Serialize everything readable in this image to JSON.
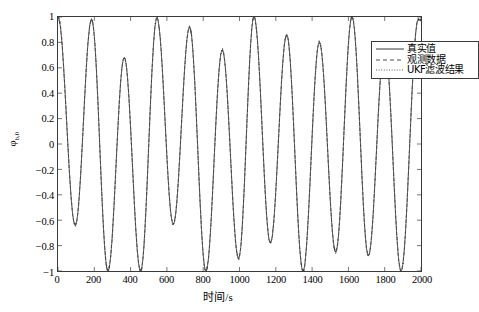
{
  "chart_data": {
    "type": "line",
    "title": "",
    "xlabel": "时间/s",
    "ylabel": "φb,0",
    "xlim": [
      0,
      2000
    ],
    "ylim": [
      -1,
      1
    ],
    "xticks": [
      0,
      200,
      400,
      600,
      800,
      1000,
      1200,
      1400,
      1600,
      1800,
      2000
    ],
    "yticks": [
      -1,
      -0.8,
      -0.6,
      -0.4,
      -0.2,
      0,
      0.2,
      0.4,
      0.6,
      0.8,
      1
    ],
    "xtick_labels": [
      "0",
      "200",
      "400",
      "600",
      "800",
      "1000",
      "1200",
      "1400",
      "1600",
      "1800",
      "2000"
    ],
    "ytick_labels": [
      "-1",
      "-0.8",
      "-0.6",
      "-0.4",
      "-0.2",
      "0",
      "0.2",
      "0.4",
      "0.6",
      "0.8",
      "1"
    ],
    "grid": false,
    "legend_position": "top-right",
    "period": 180,
    "series": [
      {
        "name": "真实值",
        "style": "solid",
        "color": "#222222",
        "peaks": [
          {
            "x": 0,
            "y": 1.0
          },
          {
            "x": 185,
            "y": 0.98
          },
          {
            "x": 365,
            "y": 0.68
          },
          {
            "x": 545,
            "y": 0.99
          },
          {
            "x": 725,
            "y": 0.92
          },
          {
            "x": 905,
            "y": 0.74
          },
          {
            "x": 1080,
            "y": 1.0
          },
          {
            "x": 1260,
            "y": 0.86
          },
          {
            "x": 1440,
            "y": 0.8
          },
          {
            "x": 1620,
            "y": 1.0
          },
          {
            "x": 1800,
            "y": 0.79
          },
          {
            "x": 1985,
            "y": 0.98
          }
        ],
        "troughs": [
          {
            "x": 95,
            "y": -0.64
          },
          {
            "x": 275,
            "y": -1.0
          },
          {
            "x": 455,
            "y": -1.0
          },
          {
            "x": 635,
            "y": -0.63
          },
          {
            "x": 815,
            "y": -1.0
          },
          {
            "x": 995,
            "y": -0.9
          },
          {
            "x": 1170,
            "y": -0.78
          },
          {
            "x": 1350,
            "y": -1.0
          },
          {
            "x": 1530,
            "y": -0.85
          },
          {
            "x": 1710,
            "y": -0.88
          },
          {
            "x": 1890,
            "y": -1.0
          }
        ]
      },
      {
        "name": "观测数据",
        "style": "dashed",
        "color": "#333333",
        "note": "noisy measurement, overlaps true value"
      },
      {
        "name": "UKF滤波结果",
        "style": "dotted",
        "color": "#444444",
        "note": "filter output, overlaps true value"
      }
    ]
  },
  "legend": {
    "entries": [
      {
        "label": "真实值",
        "style": "solid"
      },
      {
        "label": "观测数据",
        "style": "dashed"
      },
      {
        "label": "UKF滤波结果",
        "style": "dotted"
      }
    ]
  },
  "axes": {
    "xlabel": "时间/s",
    "ylabel_base": "φ",
    "ylabel_sub": "b,0"
  }
}
